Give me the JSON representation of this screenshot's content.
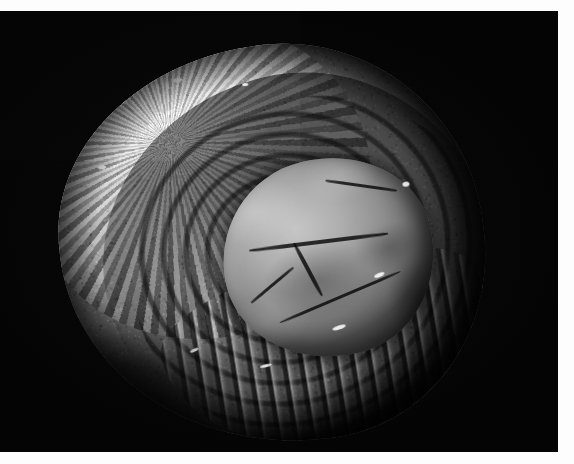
{
  "image": {
    "kind": "photograph",
    "medium": "black-and-white photographic plate",
    "subject": "fossilized bivalve (oyster) shell specimen",
    "orientation": "landscape",
    "width_px": 574,
    "height_px": 464,
    "caption": "",
    "alt_text": "Black and white photograph of a fossilized oyster shell specimen on a black background"
  },
  "plate": {
    "matte_color": "#fdfdfd",
    "field_color": "#040404",
    "border": {
      "top_px": 11,
      "right_px": 16,
      "bottom_px": 12,
      "left_px": 0
    }
  },
  "specimen": {
    "label": "fossil-specimen",
    "tone_range": {
      "highlight": "#e8e8e8",
      "midtone": "#9a9a9a",
      "shadow": "#2a2a2a"
    },
    "bounds_px": {
      "left": 55,
      "top": 37,
      "right": 492,
      "bottom": 442
    },
    "features": [
      {
        "name": "granular-crust",
        "region": "upper-left",
        "description": "coarse rough mineral crust, high-contrast speckled texture"
      },
      {
        "name": "central-boss",
        "region": "center-right",
        "description": "smooth rounded umbo with mid-grey mottling and dark fractures"
      },
      {
        "name": "concentric-growth-ridges",
        "region": "surrounding-boss",
        "description": "nested arc ridges with bright specular highlights"
      },
      {
        "name": "lamellae-layers",
        "region": "lower-right",
        "description": "stacked plate-like shell layers catching raking light"
      },
      {
        "name": "shadowed-margin",
        "region": "lower-left",
        "description": "deep shadow where specimen edge falls into the black ground"
      }
    ]
  },
  "background": {
    "name": "black-field",
    "color": "#040404",
    "description": "uniform dark studio backdrop"
  }
}
